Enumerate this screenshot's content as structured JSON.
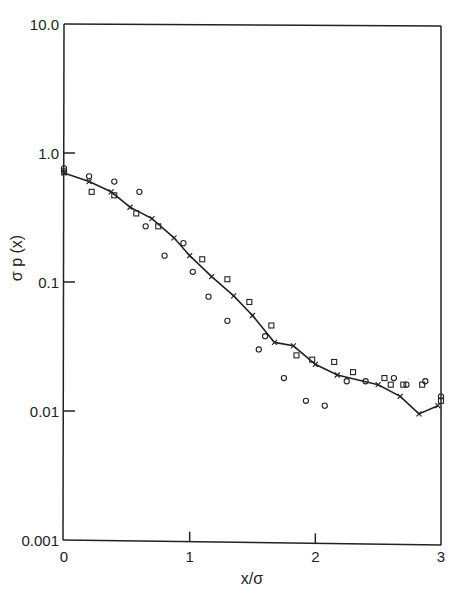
{
  "chart_data": {
    "type": "scatter",
    "title": "",
    "xlabel": "x/σ",
    "ylabel": "σ p (x)",
    "xlim": [
      0,
      3
    ],
    "ylim": [
      0.001,
      10.0
    ],
    "yscale": "log",
    "grid": false,
    "legend": null,
    "x_ticks": [
      "0",
      "1",
      "2",
      "3"
    ],
    "y_ticks": [
      "10.0",
      "1.0",
      "0.1",
      "0.01",
      "0.001"
    ],
    "series": [
      {
        "name": "line-with-crosses",
        "marker": "x",
        "style": "line",
        "x": [
          0.0,
          0.2,
          0.375,
          0.525,
          0.7,
          0.875,
          1.0,
          1.175,
          1.35,
          1.5,
          1.675,
          1.825,
          2.0,
          2.175,
          2.5,
          2.675,
          2.825,
          2.975
        ],
        "y": [
          0.7,
          0.6,
          0.5,
          0.38,
          0.31,
          0.22,
          0.16,
          0.11,
          0.078,
          0.055,
          0.034,
          0.032,
          0.023,
          0.019,
          0.016,
          0.013,
          0.0095,
          0.011
        ]
      },
      {
        "name": "squares",
        "marker": "square",
        "style": "points",
        "x": [
          0.0,
          0.22,
          0.4,
          0.575,
          0.75,
          1.1,
          1.3,
          1.475,
          1.65,
          1.85,
          1.975,
          2.15,
          2.3,
          2.55,
          2.6,
          2.7,
          2.85,
          3.0
        ],
        "y": [
          0.72,
          0.5,
          0.47,
          0.34,
          0.27,
          0.15,
          0.105,
          0.07,
          0.046,
          0.027,
          0.025,
          0.024,
          0.02,
          0.018,
          0.016,
          0.016,
          0.016,
          0.012
        ]
      },
      {
        "name": "circles",
        "marker": "circle",
        "style": "points",
        "x": [
          0.0,
          0.2,
          0.4,
          0.6,
          0.65,
          0.8,
          0.95,
          1.025,
          1.15,
          1.3,
          1.55,
          1.6,
          1.75,
          1.925,
          2.075,
          2.25,
          2.4,
          2.625,
          2.725,
          2.875,
          3.0
        ],
        "y": [
          0.76,
          0.66,
          0.6,
          0.5,
          0.27,
          0.16,
          0.2,
          0.12,
          0.077,
          0.05,
          0.03,
          0.038,
          0.018,
          0.012,
          0.011,
          0.017,
          0.017,
          0.018,
          0.016,
          0.017,
          0.013
        ]
      }
    ]
  }
}
